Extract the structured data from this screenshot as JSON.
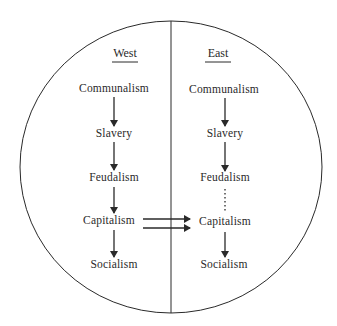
{
  "diagram": {
    "type": "circle-split-flow",
    "columns": [
      {
        "header": "West",
        "stages": [
          "Communalism",
          "Slavery",
          "Feudalism",
          "Capitalism",
          "Socialism"
        ],
        "connectors": [
          "solid-arrow",
          "solid-arrow",
          "solid-arrow",
          "solid-arrow"
        ]
      },
      {
        "header": "East",
        "stages": [
          "Communalism",
          "Slavery",
          "Feudalism",
          "Capitalism",
          "Socialism"
        ],
        "connectors": [
          "solid-arrow",
          "solid-arrow",
          "dotted-line",
          "solid-arrow"
        ]
      }
    ],
    "cross_links": [
      {
        "from": "West.Capitalism",
        "to": "East.Capitalism",
        "style": "double-arrow"
      }
    ],
    "colors": {
      "line": "#2a2a2a",
      "background": "#ffffff"
    }
  }
}
